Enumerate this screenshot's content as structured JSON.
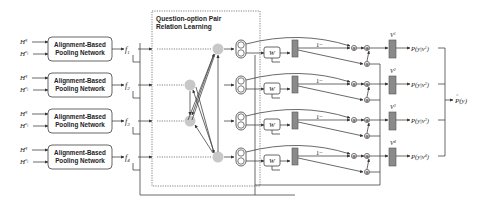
{
  "diagram": {
    "inputs": {
      "question": "H",
      "question_sup": "q",
      "option": "H",
      "option_sup": "o",
      "option_sub": "i"
    },
    "pooling_label_line1": "Alignment-Based",
    "pooling_label_line2": "Pooling Network",
    "features": [
      {
        "name": "f",
        "sub": "1"
      },
      {
        "name": "f",
        "sub": "2"
      },
      {
        "name": "f",
        "sub": "3"
      },
      {
        "name": "f",
        "sub": "4"
      }
    ],
    "relation_box_title_line1": "Question-option Pair",
    "relation_box_title_line2": "Relation Learning",
    "weight_label": "W",
    "gate_label": "1−",
    "v_labels": [
      {
        "name": "V",
        "sup": "1"
      },
      {
        "name": "V",
        "sup": "2"
      },
      {
        "name": "V",
        "sup": "3"
      },
      {
        "name": "V",
        "sup": "4"
      }
    ],
    "prob_labels": [
      {
        "text": "P(y|v",
        "sup": "1",
        "close": ")"
      },
      {
        "text": "P(y|v",
        "sup": "2",
        "close": ")"
      },
      {
        "text": "P(y|v",
        "sup": "3",
        "close": ")"
      },
      {
        "text": "P(y|v",
        "sup": "4",
        "close": ")"
      }
    ],
    "output_label": "P(y)",
    "output_hat": "^"
  }
}
